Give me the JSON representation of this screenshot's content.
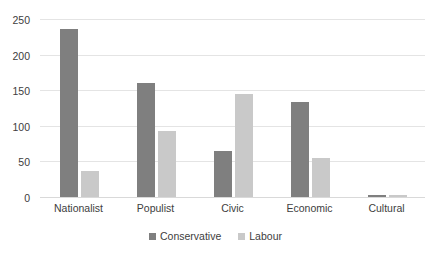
{
  "chart_data": {
    "type": "bar",
    "title": "",
    "xlabel": "",
    "ylabel": "",
    "categories": [
      "Nationalist",
      "Populist",
      "Civic",
      "Economic",
      "Cultural"
    ],
    "series": [
      {
        "name": "Conservative",
        "color": "#7f7f7f",
        "values": [
          237,
          161,
          66,
          135,
          4
        ]
      },
      {
        "name": "Labour",
        "color": "#c9c9c9",
        "values": [
          38,
          94,
          146,
          56,
          4
        ]
      }
    ],
    "ylim": [
      0,
      250
    ],
    "yticks": [
      0,
      50,
      100,
      150,
      200,
      250
    ],
    "ytick_labels": [
      "0",
      "50",
      "100",
      "150",
      "200",
      "250"
    ],
    "grid": true,
    "grid_axis": "y",
    "legend_position": "bottom"
  }
}
